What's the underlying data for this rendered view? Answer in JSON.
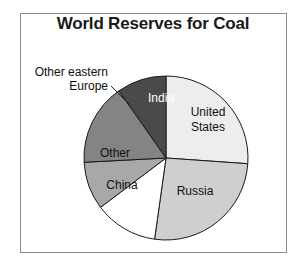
{
  "frame": {
    "border_color": "#8a8a8a",
    "background": "#ffffff"
  },
  "chart_data": {
    "type": "pie",
    "title": "World Reserves for Coal",
    "xlabel": "",
    "ylabel": "",
    "legend_position": "none",
    "grid": false,
    "categories": [
      "United States",
      "Russia",
      "China",
      "Other",
      "Other eastern Europe",
      "India"
    ],
    "values": [
      26,
      26,
      12.5,
      9.5,
      16,
      10
    ],
    "labels": [
      "United States",
      "Russia",
      "China",
      "Other",
      "Other eastern Europe",
      "India"
    ],
    "slices": [
      {
        "name": "United States",
        "label": "United States",
        "label_line1": "United",
        "label_line2": "States",
        "value": 26,
        "start_angle": 0,
        "end_angle": 94,
        "color": "#ededed",
        "label_color": "#111111",
        "label_placement": "inside"
      },
      {
        "name": "Russia",
        "label": "Russia",
        "value": 26,
        "start_angle": 94,
        "end_angle": 188,
        "color": "#cfcfcf",
        "label_color": "#111111",
        "label_placement": "inside"
      },
      {
        "name": "China",
        "label": "China",
        "value": 12.5,
        "start_angle": 188,
        "end_angle": 233,
        "color": "#ffffff",
        "label_color": "#111111",
        "label_placement": "inside"
      },
      {
        "name": "Other",
        "label": "Other",
        "value": 9.5,
        "start_angle": 233,
        "end_angle": 267,
        "color": "#a8a8a8",
        "label_color": "#111111",
        "label_placement": "inside"
      },
      {
        "name": "Other eastern Europe",
        "label": "Other eastern Europe",
        "label_line1": "Other eastern",
        "label_line2": "Europe",
        "value": 16,
        "start_angle": 267,
        "end_angle": 325,
        "color": "#848484",
        "label_color": "#111111",
        "label_placement": "callout"
      },
      {
        "name": "India",
        "label": "India",
        "value": 10,
        "start_angle": 325,
        "end_angle": 360,
        "color": "#4a4a4a",
        "label_color": "#ffffff",
        "label_placement": "inside"
      }
    ],
    "outline_color": "#1a1a1a",
    "center": {
      "x": 166,
      "y": 158
    },
    "radius": 82
  }
}
